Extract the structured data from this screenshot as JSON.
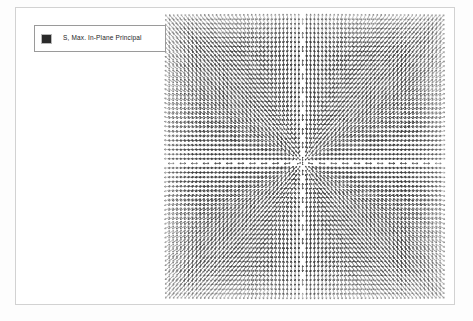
{
  "window": {
    "background_color": "#fdfdfd",
    "viewport_background": "#ffffff",
    "viewport_border_color": "#d2d2d2"
  },
  "legend": {
    "label": "S, Max. In-Plane Principal",
    "swatch_color": "#2a2a2a",
    "border_color": "#9a9a9a",
    "background_color": "#ffffff"
  },
  "chart_data": {
    "type": "scatter",
    "title": "S, Max. In-Plane Principal",
    "subtitle": "",
    "xlabel": "",
    "ylabel": "",
    "plot_kind": "principal-stress-symbol-plot",
    "legend_entries": [
      "S, Max. In-Plane Principal"
    ],
    "legend_position": "top-left",
    "grid": false,
    "axis_visible": false,
    "field": {
      "x0": 152,
      "y0": 9,
      "x1": 428,
      "y1": 290,
      "center_x": 288,
      "center_y": 155,
      "cols": 72,
      "rows": 62,
      "symbol_color": "#3a3a3a",
      "symbol_length": 6.2,
      "symbol_width": 0.85,
      "orientation_rule": "radial-from-center",
      "channel_halfwidth": 3.0,
      "edge_fade": 0.12
    },
    "series": [
      {
        "name": "S, Max. In-Plane Principal",
        "color": "#3a3a3a",
        "marker": "double-arrow",
        "point_count": 4464
      }
    ]
  }
}
